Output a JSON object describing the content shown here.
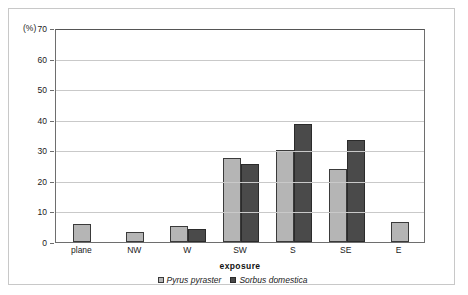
{
  "chart_data": {
    "type": "bar",
    "title": "",
    "subtitle": "",
    "xlabel": "exposure",
    "ylabel": "(%)",
    "ylim": [
      0,
      70
    ],
    "yticks": [
      0,
      10,
      20,
      30,
      40,
      50,
      60,
      70
    ],
    "grid": "horizontal",
    "legend_position": "bottom",
    "categories": [
      "plane",
      "NW",
      "W",
      "SW",
      "S",
      "SE",
      "E"
    ],
    "series": [
      {
        "name": "Pyrus pyraster",
        "color": "#b5b5b5",
        "values": [
          6.0,
          3.3,
          5.3,
          27.5,
          30.0,
          24.0,
          6.7
        ]
      },
      {
        "name": "Sorbus domestica",
        "color": "#4a4a4a",
        "values": [
          0,
          0,
          4.2,
          25.5,
          38.5,
          33.5,
          0
        ]
      }
    ]
  }
}
